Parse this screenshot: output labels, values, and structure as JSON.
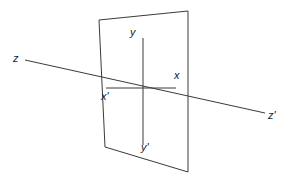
{
  "figure": {
    "kind": "line-diagram",
    "background_color": "#ffffff",
    "stroke_color": "#3a3a3a",
    "text_color": "#1a1a1a",
    "width": 293,
    "height": 185
  },
  "plane": {
    "name": "vertical-plane",
    "points": "99,20 188,11 188,172 105,147",
    "fill": "none",
    "stroke_width": 1
  },
  "axes": {
    "z_axis": {
      "label": "z",
      "prime_label": "z'",
      "x1": 25,
      "y1": 60,
      "x2": 265,
      "y2": 113
    },
    "y_axis": {
      "label": "y",
      "prime_label": "y'",
      "x1": 143,
      "y1": 38,
      "x2": 143,
      "y2": 145
    },
    "x_axis": {
      "label": "x",
      "prime_label": "x'",
      "x1": 106,
      "y1": 88,
      "x2": 176,
      "y2": 88
    },
    "origin": {
      "x": 143,
      "y": 88
    }
  },
  "labels": [
    {
      "id": "label-z",
      "text": "z",
      "left": 13,
      "top": 53
    },
    {
      "id": "label-y",
      "text": "y",
      "left": 130,
      "top": 27
    },
    {
      "id": "label-x",
      "text": "x",
      "left": 174,
      "top": 70
    },
    {
      "id": "label-x-prime",
      "text": "x'",
      "left": 101,
      "top": 91
    },
    {
      "id": "label-y-prime",
      "text": "y'",
      "left": 141,
      "top": 142
    },
    {
      "id": "label-z-prime",
      "text": "z'",
      "left": 268,
      "top": 110
    }
  ]
}
